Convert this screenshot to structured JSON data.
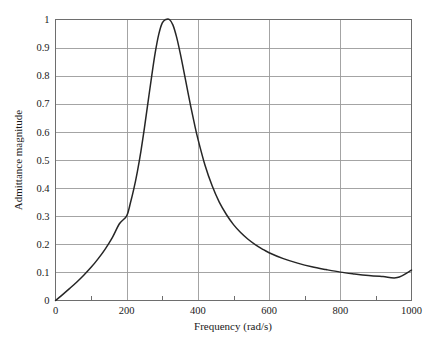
{
  "chart_data": {
    "type": "line",
    "title": "",
    "xlabel": "Frequency (rad/s)",
    "ylabel": "Admittance magnitude",
    "xlim": [
      0,
      1000
    ],
    "ylim": [
      0,
      1
    ],
    "grid": true,
    "legend": null,
    "xticks": [
      0,
      200,
      400,
      600,
      800,
      1000
    ],
    "xtick_labels": [
      "0",
      "200",
      "400",
      "600",
      "800",
      "1000"
    ],
    "xminor_ticks": [
      100,
      300,
      500,
      700,
      900
    ],
    "yticks": [
      0,
      0.1,
      0.2,
      0.3,
      0.4,
      0.5,
      0.6,
      0.7,
      0.8,
      0.9,
      1
    ],
    "ytick_labels": [
      "0",
      "0.1",
      "0.2",
      "0.3",
      "0.4",
      "0.5",
      "0.6",
      "0.7",
      "0.8",
      "0.9",
      "1"
    ],
    "series": [
      {
        "name": "Admittance magnitude",
        "color": "#262626",
        "peak_x": 320,
        "peak_y": 1.0,
        "x": [
          0,
          20,
          40,
          60,
          80,
          100,
          120,
          140,
          160,
          180,
          200,
          210,
          220,
          230,
          240,
          250,
          260,
          270,
          280,
          290,
          300,
          310,
          320,
          330,
          340,
          350,
          360,
          370,
          380,
          390,
          400,
          420,
          440,
          460,
          480,
          500,
          520,
          540,
          560,
          580,
          600,
          640,
          680,
          720,
          760,
          800,
          840,
          880,
          920,
          960,
          1000
        ],
        "y": [
          0.0,
          0.021,
          0.043,
          0.066,
          0.091,
          0.118,
          0.149,
          0.184,
          0.225,
          0.274,
          0.301,
          0.345,
          0.397,
          0.459,
          0.532,
          0.616,
          0.707,
          0.797,
          0.881,
          0.947,
          0.988,
          1.0,
          1.0,
          0.98,
          0.938,
          0.882,
          0.819,
          0.754,
          0.69,
          0.63,
          0.575,
          0.481,
          0.408,
          0.35,
          0.306,
          0.27,
          0.242,
          0.219,
          0.2,
          0.184,
          0.17,
          0.149,
          0.133,
          0.12,
          0.11,
          0.101,
          0.0945,
          0.089,
          0.085,
          0.0815,
          0.108
        ]
      }
    ]
  },
  "axes": {
    "x_title": "Frequency (rad/s)",
    "y_title": "Admittance magnitude"
  },
  "ticks": {
    "x": [
      "0",
      "200",
      "400",
      "600",
      "800",
      "1000"
    ],
    "y": [
      "0",
      "0.1",
      "0.2",
      "0.3",
      "0.4",
      "0.5",
      "0.6",
      "0.7",
      "0.8",
      "0.9",
      "1"
    ]
  },
  "colors": {
    "curve": "#262626",
    "grid": "#9a9a9a",
    "frame": "#6e6e6e",
    "background": "#ffffff",
    "text": "#1a1a1a"
  }
}
